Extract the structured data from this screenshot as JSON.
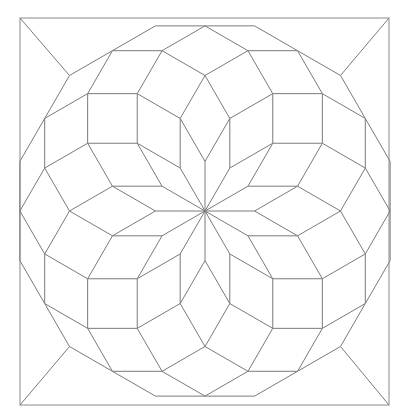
{
  "figure": {
    "stroke_color": "#7a7a7a",
    "frame_color": "#8a8a8a",
    "background": "#ffffff"
  },
  "geometry": {
    "center": [
      205,
      211
    ],
    "edge": 49.6,
    "rings": 5,
    "rotation_deg": 90,
    "frame": {
      "x1": 20,
      "y1": 18,
      "x2": 389,
      "y2": 405
    }
  }
}
